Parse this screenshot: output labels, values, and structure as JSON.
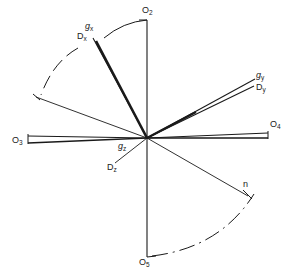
{
  "figure": {
    "type": "vector-direction-diagram",
    "background_color": "#ffffff",
    "line_color": "#1a1a1a",
    "center": {
      "x": 147,
      "y": 138
    },
    "labels": {
      "o2": {
        "base": "O",
        "sub": "2"
      },
      "o3": {
        "base": "O",
        "sub": "3"
      },
      "o4": {
        "base": "O",
        "sub": "4"
      },
      "o5": {
        "base": "O",
        "sub": "5"
      },
      "gx": {
        "base": "g",
        "sub": "x"
      },
      "dx": {
        "base": "D",
        "sub": "x"
      },
      "gy": {
        "base": "g",
        "sub": "y"
      },
      "dy": {
        "base": "D",
        "sub": "y"
      },
      "gz": {
        "base": "g",
        "sub": "z"
      },
      "dz": {
        "base": "D",
        "sub": "z"
      },
      "n": {
        "base": "n",
        "sub": ""
      }
    },
    "rays": [
      {
        "name": "axis-o2",
        "label": "O2",
        "angle_deg": 90,
        "style": "thin"
      },
      {
        "name": "axis-o5",
        "label": "O5",
        "angle_deg": 270,
        "style": "thin"
      },
      {
        "name": "axis-o3",
        "label": "O3",
        "angle_deg": 180,
        "style": "thin"
      },
      {
        "name": "axis-o4",
        "label": "O4",
        "angle_deg": 0,
        "style": "thin"
      },
      {
        "name": "vector-gx-dx",
        "label": "gx/Dx",
        "angle_deg": 118,
        "style": "thick"
      },
      {
        "name": "vector-gy-dy",
        "label": "gy/Dy",
        "angle_deg": 26,
        "style": "double"
      },
      {
        "name": "vector-gz-dz",
        "label": "gz/Dz",
        "angle_deg": 182,
        "style": "thin"
      }
    ],
    "arcs": [
      {
        "name": "arc-top-solid",
        "style": "solid",
        "from_deg": 90,
        "to_deg": 122
      },
      {
        "name": "arc-upper-left-dashed",
        "style": "dashed",
        "from_deg": 128,
        "to_deg": 163
      },
      {
        "name": "arc-lower-right-dashdot",
        "style": "dash-dot",
        "from_deg": 270,
        "to_deg": 332
      }
    ]
  }
}
